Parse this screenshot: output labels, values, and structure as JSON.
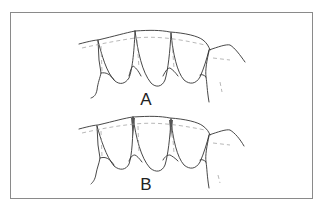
{
  "figure": {
    "panels": [
      {
        "id": "panel-a",
        "label": "A"
      },
      {
        "id": "panel-b",
        "label": "B"
      }
    ],
    "colors": {
      "line": "#333333",
      "dashed": "#9a9a9a",
      "frame": "#8a8a8a",
      "background": "#ffffff"
    }
  }
}
